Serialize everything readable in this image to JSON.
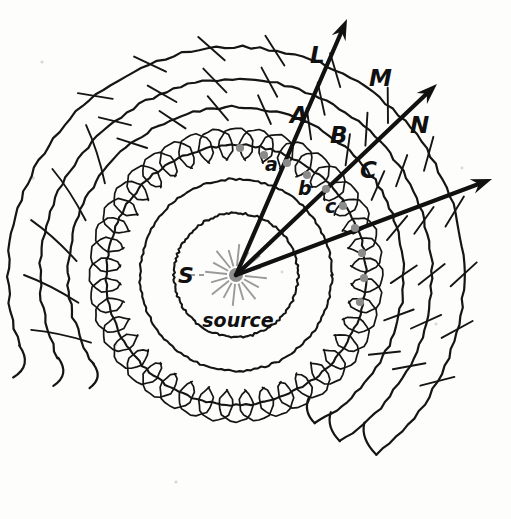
{
  "figure": {
    "kind": "huygens-wavefront-diagram",
    "title": "",
    "background_color": "#fdfdfb",
    "ink_color": "#151515",
    "marker_color": "#8b8b8b",
    "source": {
      "label": "S",
      "caption": "source",
      "center_x": 236,
      "center_y": 275,
      "core_radius": 7,
      "spoke_count": 16,
      "spoke_inner": 9,
      "spoke_outer": 26,
      "color": "#8d8d8d"
    },
    "wavefronts": [
      {
        "name": "inner-front-1",
        "radius": 62,
        "style": "plain"
      },
      {
        "name": "inner-front-2",
        "radius": 96,
        "style": "plain"
      },
      {
        "name": "wavelet-front",
        "radius": 130,
        "style": "wavelets"
      },
      {
        "name": "outer-front-1",
        "radius": 168,
        "style": "arc-partial"
      },
      {
        "name": "outer-front-2",
        "radius": 196,
        "style": "arc-partial"
      },
      {
        "name": "outer-front-3",
        "radius": 228,
        "style": "arc-partial"
      }
    ],
    "wavelet_ring": {
      "on_radius": 130,
      "wavelet_radius": 17,
      "count": 40
    },
    "rays": [
      {
        "name": "ray-L",
        "label": "L",
        "label_x": 310,
        "label_y": 63,
        "tip_x": 347,
        "tip_y": 19,
        "angle_deg": 292
      },
      {
        "name": "ray-M",
        "label": "M",
        "label_x": 369,
        "label_y": 86,
        "tip_x": 437,
        "tip_y": 84,
        "angle_deg": 316
      },
      {
        "name": "ray-N",
        "label": "N",
        "label_x": 410,
        "label_y": 133,
        "tip_x": 492,
        "tip_y": 179,
        "angle_deg": 338
      }
    ],
    "wavefront_labels_upper": [
      {
        "text": "A",
        "x": 290,
        "y": 123
      },
      {
        "text": "B",
        "x": 330,
        "y": 143
      },
      {
        "text": "C",
        "x": 360,
        "y": 178
      }
    ],
    "wavelet_labels_lower": [
      {
        "text": "a",
        "x": 265,
        "y": 171
      },
      {
        "text": "b",
        "x": 298,
        "y": 195
      },
      {
        "text": "c",
        "x": 325,
        "y": 213
      }
    ],
    "marker_dots": [
      {
        "x": 240,
        "y": 148
      },
      {
        "x": 264,
        "y": 155
      },
      {
        "x": 287,
        "y": 163
      },
      {
        "x": 307,
        "y": 175
      },
      {
        "x": 326,
        "y": 189
      },
      {
        "x": 343,
        "y": 206
      },
      {
        "x": 355,
        "y": 228
      },
      {
        "x": 362,
        "y": 253
      },
      {
        "x": 364,
        "y": 278
      },
      {
        "x": 360,
        "y": 302
      }
    ]
  }
}
